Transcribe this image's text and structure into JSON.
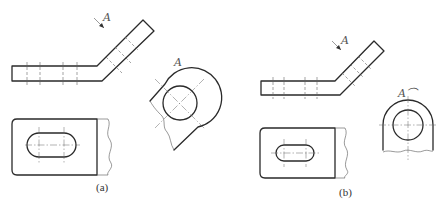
{
  "figure": {
    "panels": [
      {
        "id": "a",
        "caption": "(a)",
        "view_arrow_label": "A",
        "aux_view_label": "A"
      },
      {
        "id": "b",
        "caption": "(b)",
        "view_arrow_label": "A",
        "aux_view_label": "A⌒"
      }
    ]
  },
  "colors": {
    "line": "#2a2a2a",
    "thin_line": "#555555",
    "background": "#ffffff"
  }
}
